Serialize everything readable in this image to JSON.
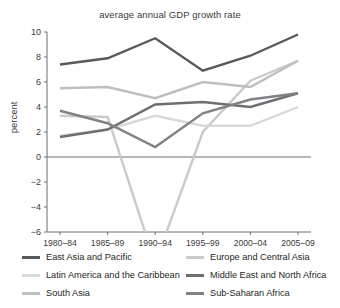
{
  "chart_data": {
    "type": "line",
    "title": "average annual GDP growth rate",
    "xlabel": "",
    "ylabel": "percent",
    "categories": [
      "1980–84",
      "1985–89",
      "1990–94",
      "1995–99",
      "2000–04",
      "2005–09"
    ],
    "ylim": [
      -6,
      10
    ],
    "yticks": [
      10,
      8,
      6,
      4,
      2,
      0,
      -2,
      -4,
      -6
    ],
    "ytick_labels": [
      "10",
      "8",
      "6",
      "4",
      "2",
      "0",
      "−2",
      "−4",
      "−6"
    ],
    "grid": false,
    "legend_position": "bottom",
    "zero_line": true,
    "series": [
      {
        "name": "East Asia and Pacific",
        "color": "#58595b",
        "values": [
          7.4,
          7.9,
          9.5,
          6.9,
          8.1,
          9.8
        ]
      },
      {
        "name": "Europe and Central Asia",
        "color": "#c9cacc",
        "values": [
          3.3,
          3.2,
          -8.5,
          2.0,
          6.1,
          7.7
        ]
      },
      {
        "name": "Latin America and the Caribbean",
        "color": "#d8d9da",
        "values": [
          1.7,
          2.2,
          3.3,
          2.5,
          2.5,
          4.0
        ]
      },
      {
        "name": "Middle East and North Africa",
        "color": "#6d6e71",
        "values": [
          1.6,
          2.2,
          4.2,
          4.4,
          4.0,
          5.1
        ]
      },
      {
        "name": "South Asia",
        "color": "#bcbec0",
        "values": [
          5.5,
          5.6,
          4.7,
          6.0,
          5.6,
          7.7
        ]
      },
      {
        "name": "Sub-Saharan Africa",
        "color": "#808285",
        "values": [
          3.7,
          2.7,
          0.8,
          3.5,
          4.6,
          5.1
        ]
      }
    ]
  },
  "legend": {
    "columns": [
      {
        "items": [
          {
            "label": "East Asia and Pacific",
            "color": "#58595b",
            "thickness": 3.4
          },
          {
            "label": "Latin America and the Caribbean",
            "color": "#d8d9da",
            "thickness": 2.6
          },
          {
            "label": "South Asia",
            "color": "#bcbec0",
            "thickness": 2.8
          }
        ]
      },
      {
        "items": [
          {
            "label": "Europe and Central Asia",
            "color": "#c9cacc",
            "thickness": 2.6
          },
          {
            "label": "Middle East and North Africa",
            "color": "#6d6e71",
            "thickness": 3.2
          },
          {
            "label": "Sub-Saharan Africa",
            "color": "#808285",
            "thickness": 3.2
          }
        ]
      }
    ]
  }
}
